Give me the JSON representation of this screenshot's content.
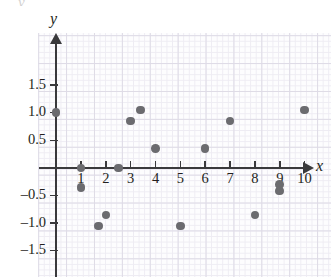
{
  "top_remnant_text": "y",
  "axes": {
    "x_name": "x",
    "y_name": "y",
    "x_ticks": [
      {
        "value": 1,
        "label": "1"
      },
      {
        "value": 2,
        "label": "2"
      },
      {
        "value": 3,
        "label": "3"
      },
      {
        "value": 4,
        "label": "4"
      },
      {
        "value": 5,
        "label": "5"
      },
      {
        "value": 6,
        "label": "6"
      },
      {
        "value": 7,
        "label": "7"
      },
      {
        "value": 8,
        "label": "8"
      },
      {
        "value": 9,
        "label": "9"
      },
      {
        "value": 10,
        "label": "10"
      }
    ],
    "y_ticks": [
      {
        "value": 1.5,
        "label": "1.5"
      },
      {
        "value": 1.0,
        "label": "1.0"
      },
      {
        "value": 0.5,
        "label": "0.5"
      },
      {
        "value": -0.5,
        "label": "–0.5"
      },
      {
        "value": -1.0,
        "label": "–1.0"
      },
      {
        "value": -1.5,
        "label": "–1.5"
      }
    ]
  },
  "colors": {
    "dot": "#6b6b6f",
    "axis": "#3a3a3c",
    "grid_minor": "#eeecf3",
    "grid_major": "#dedbe6",
    "paper": "#fdfdfe",
    "text": "#231f20"
  },
  "chart_data": {
    "type": "scatter",
    "title": "",
    "subtitle": "",
    "xlabel": "x",
    "ylabel": "y",
    "xlim": [
      -0.7,
      10.8
    ],
    "ylim": [
      -2.45,
      1.95
    ],
    "xticks": [
      1,
      2,
      3,
      4,
      5,
      6,
      7,
      8,
      9,
      10
    ],
    "yticks": [
      1.5,
      1.0,
      0.5,
      -0.5,
      -1.0,
      -1.5
    ],
    "grid": true,
    "legend": null,
    "annotations": [],
    "series": [
      {
        "name": "data",
        "marker": "filled-circle",
        "color": "#6b6b6f",
        "points": [
          {
            "x": 0.0,
            "y": 1.0
          },
          {
            "x": 1.0,
            "y": 0.0
          },
          {
            "x": 1.0,
            "y": -0.35
          },
          {
            "x": 1.7,
            "y": -1.05
          },
          {
            "x": 2.0,
            "y": -0.85
          },
          {
            "x": 2.5,
            "y": 0.0
          },
          {
            "x": 3.0,
            "y": 0.85
          },
          {
            "x": 3.4,
            "y": 1.05
          },
          {
            "x": 4.0,
            "y": 0.35
          },
          {
            "x": 5.0,
            "y": -1.05
          },
          {
            "x": 6.0,
            "y": 0.35
          },
          {
            "x": 7.0,
            "y": 0.85
          },
          {
            "x": 8.0,
            "y": -0.85
          },
          {
            "x": 9.0,
            "y": -0.3
          },
          {
            "x": 9.0,
            "y": -0.42
          },
          {
            "x": 10.0,
            "y": 1.05
          }
        ]
      }
    ]
  }
}
